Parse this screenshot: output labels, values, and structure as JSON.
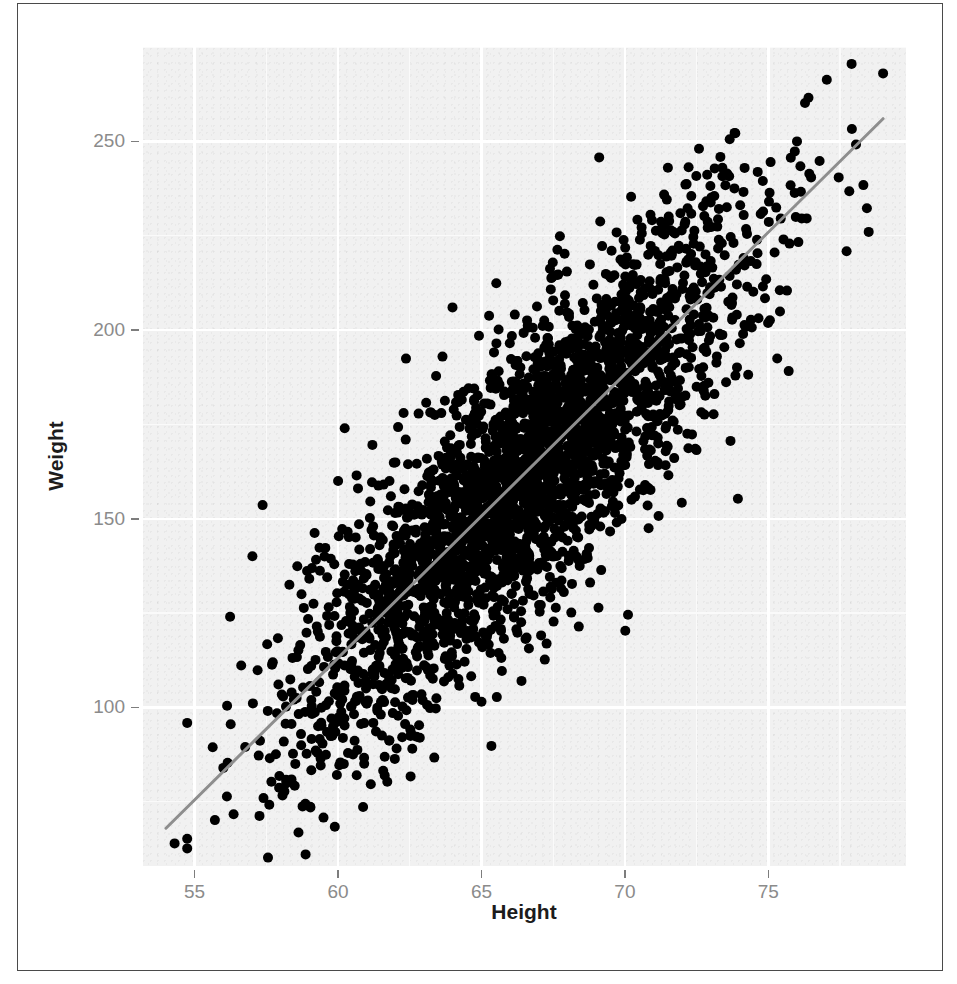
{
  "figure": {
    "caption_fragment": ""
  },
  "chart_data": {
    "type": "scatter",
    "title": "",
    "xlabel": "Height",
    "ylabel": "Weight",
    "xlim": [
      53.2,
      79.8
    ],
    "ylim": [
      58,
      275
    ],
    "grid": true,
    "legend": null,
    "panel_background": "#f1f1f1",
    "gridline_color": "#ffffff",
    "point_color": "#000000",
    "point_size_px": 10,
    "n_points_approx": 3000,
    "x_ticks": [
      55,
      60,
      65,
      70,
      75
    ],
    "y_ticks": [
      100,
      150,
      200,
      250
    ],
    "x_minor_ticks": [
      57.5,
      62.5,
      67.5,
      72.5,
      77.5
    ],
    "y_minor_ticks": [
      75,
      125,
      175,
      225,
      275
    ],
    "correlation_approx": 0.84,
    "trend": {
      "type": "linear-regression",
      "color": "#8e8e8e",
      "width_px": 3,
      "x_start": 54.0,
      "y_start": 68.0,
      "x_end": 79.0,
      "y_end": 256.0,
      "slope": 7.52,
      "intercept": -338.1
    },
    "series": [
      {
        "name": "Height vs Weight",
        "x_mean": 66.4,
        "y_mean": 161.0,
        "x_sd": 3.85,
        "y_sd": 34.5,
        "notable_points": [
          {
            "x": 79.0,
            "y": 268.0,
            "note": "top-right outlier, maximum weight"
          },
          {
            "x": 54.3,
            "y": 64.0,
            "note": "bottom-left extreme, minimum weight"
          },
          {
            "x": 78.5,
            "y": 226.0,
            "note": "right edge low-weight point"
          },
          {
            "x": 63.6,
            "y": 178.0,
            "note": "upper-left sparse point"
          },
          {
            "x": 61.0,
            "y": 101.0,
            "note": "lower sparse point"
          },
          {
            "x": 65.0,
            "y": 101.5,
            "note": "low-weight point near centre height"
          },
          {
            "x": 56.0,
            "y": 84.0,
            "note": "left tail point"
          },
          {
            "x": 57.4,
            "y": 76.0,
            "note": "left tail low point"
          },
          {
            "x": 76.0,
            "y": 250.0,
            "note": "high right cluster"
          },
          {
            "x": 71.5,
            "y": 243.0,
            "note": "upper cluster edge"
          },
          {
            "x": 60.0,
            "y": 160.0,
            "note": "upper-left scatter"
          },
          {
            "x": 73.4,
            "y": 243.0,
            "note": "upper right scatter"
          }
        ]
      }
    ]
  },
  "axes": {
    "x": {
      "title": "Height",
      "tick_labels": [
        "55",
        "60",
        "65",
        "70",
        "75"
      ]
    },
    "y": {
      "title": "Weight",
      "tick_labels": [
        "100",
        "150",
        "200",
        "250"
      ]
    }
  }
}
